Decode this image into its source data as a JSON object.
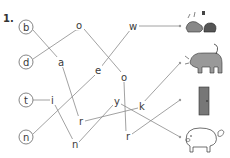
{
  "exercise": {
    "number": "1.",
    "start_letters": [
      {
        "letter": "b",
        "x": 27,
        "y": 27
      },
      {
        "letter": "d",
        "x": 27,
        "y": 62
      },
      {
        "letter": "t",
        "x": 27,
        "y": 100
      },
      {
        "letter": "n",
        "x": 27,
        "y": 137
      }
    ],
    "nodes": [
      {
        "id": "o1",
        "letter": "o",
        "x": 80,
        "y": 26
      },
      {
        "id": "a",
        "letter": "a",
        "x": 61,
        "y": 63
      },
      {
        "id": "e",
        "letter": "e",
        "x": 98,
        "y": 71
      },
      {
        "id": "w",
        "letter": "w",
        "x": 134,
        "y": 27
      },
      {
        "id": "o2",
        "letter": "o",
        "x": 124,
        "y": 77
      },
      {
        "id": "i",
        "letter": "i",
        "x": 53,
        "y": 101
      },
      {
        "id": "r1",
        "letter": "r",
        "x": 81,
        "y": 122
      },
      {
        "id": "y",
        "letter": "y",
        "x": 117,
        "y": 102
      },
      {
        "id": "k",
        "letter": "k",
        "x": 142,
        "y": 107
      },
      {
        "id": "n2",
        "letter": "n",
        "x": 75,
        "y": 145
      },
      {
        "id": "r2",
        "letter": "r",
        "x": 128,
        "y": 137
      }
    ],
    "pictures": [
      {
        "name": "shoes",
        "y": 27
      },
      {
        "name": "dog",
        "y": 63
      },
      {
        "name": "door",
        "y": 100
      },
      {
        "name": "pig",
        "y": 137
      }
    ]
  }
}
